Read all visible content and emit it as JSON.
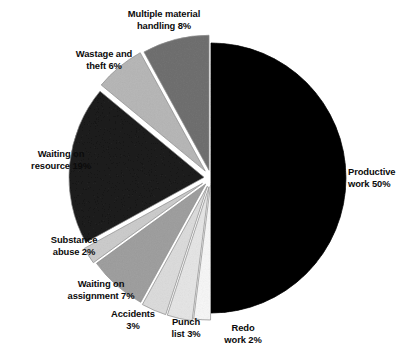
{
  "figure": {
    "background_color": "#ffffff",
    "label_color": "#0b0b0b"
  },
  "chart_data": {
    "type": "pie",
    "title": "",
    "subtitle": "",
    "xlabel": "",
    "ylabel": "",
    "legend_position": "none",
    "grid": false,
    "exploded": true,
    "start_angle_deg": 0,
    "direction": "clockwise",
    "units": "percent",
    "total": 100,
    "categories": [
      "Productive work",
      "Redo work",
      "Punch list",
      "Accidents",
      "Waiting on assignment",
      "Substance abuse",
      "Waiting on resource",
      "Wastage and theft",
      "Multiple material handling"
    ],
    "values": [
      50,
      2,
      3,
      3,
      7,
      2,
      19,
      6,
      8
    ],
    "labels": [
      "Productive\nwork 50%",
      "Redo\nwork 2%",
      "Punch\nlist 3%",
      "Accidents\n3%",
      "Waiting on\nassignment 7%",
      "Substance\nabuse 2%",
      "Waiting on\nresource 19%",
      "Wastage and\ntheft 6%",
      "Multiple material\nhandling 8%"
    ],
    "slice_colors": [
      "#070707",
      "#fbfbfb",
      "#f2f2f2",
      "#ededed",
      "#c9c9c9",
      "#e4e4e4",
      "#555555",
      "#d8d8d8",
      "#a8a8a8"
    ]
  },
  "labels": {
    "productive_work": "Productive\nwork 50%",
    "redo_work": "Redo\nwork 2%",
    "punch_list": "Punch\nlist 3%",
    "accidents": "Accidents\n3%",
    "waiting_on_assignment": "Waiting on\nassignment 7%",
    "substance_abuse": "Substance\nabuse 2%",
    "waiting_on_resource": "Waiting on\nresource 19%",
    "wastage_and_theft": "Wastage and\ntheft 6%",
    "multiple_material_handling": "Multiple material\nhandling 8%"
  }
}
